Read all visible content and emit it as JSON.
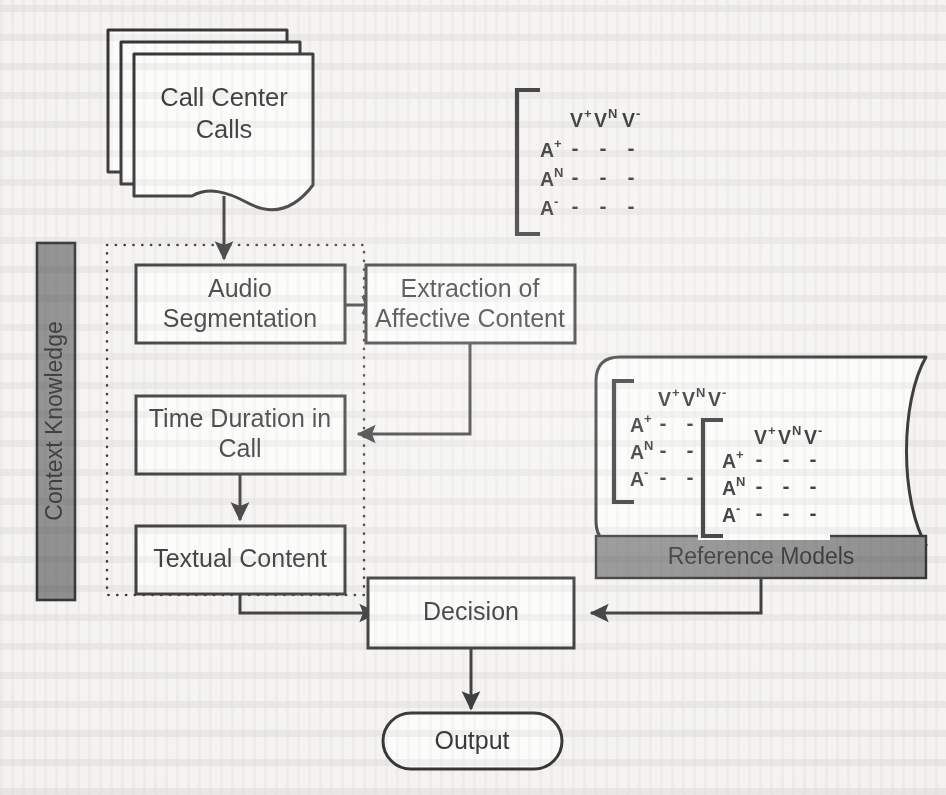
{
  "figure": {
    "background_color": "#f3f2f0",
    "line_color": "#1c1c1c",
    "shape_fill": "#fbfbfa",
    "accent_gray": "#808080",
    "boundary_style": "dotted"
  },
  "nodes": {
    "input_document": {
      "label_line1": "Call Center",
      "label_line2": "Calls",
      "shape": "multi-document"
    },
    "audio_segmentation": {
      "label_line1": "Audio",
      "label_line2": "Segmentation",
      "shape": "process"
    },
    "extraction": {
      "label_line1": "Extraction of",
      "label_line2": "Affective Content",
      "shape": "process"
    },
    "time_duration": {
      "label_line1": "Time Duration in",
      "label_line2": "Call",
      "shape": "process"
    },
    "textual_content": {
      "label_line1": "Textual Content",
      "label_line2": "",
      "shape": "process"
    },
    "decision": {
      "label_line1": "Decision",
      "label_line2": "",
      "shape": "process"
    },
    "output": {
      "label_line1": "Output",
      "label_line2": "",
      "shape": "terminator"
    },
    "context_knowledge": {
      "label": "Context Knowledge",
      "shape": "vertical-gray-bar",
      "color": "#808080"
    },
    "reference_models": {
      "label": "Reference Models",
      "shape": "data-store",
      "band_color": "#808080"
    }
  },
  "matrices": {
    "column_headers": [
      {
        "base": "V",
        "sup": "+"
      },
      {
        "base": "V",
        "sup": "N"
      },
      {
        "base": "V",
        "sup": "-"
      }
    ],
    "row_headers": [
      {
        "base": "A",
        "sup": "+"
      },
      {
        "base": "A",
        "sup": "N"
      },
      {
        "base": "A",
        "sup": "-"
      }
    ],
    "cell_value": "-",
    "instances": [
      {
        "name": "input-matrix",
        "location": "top-right"
      },
      {
        "name": "reference-matrix-back",
        "location": "data-store-left"
      },
      {
        "name": "reference-matrix-front",
        "location": "data-store-center"
      }
    ]
  },
  "edges": [
    {
      "from": "input_document",
      "to": "audio_segmentation"
    },
    {
      "from": "audio_segmentation",
      "to": "extraction"
    },
    {
      "from": "extraction",
      "to": "time_duration"
    },
    {
      "from": "time_duration",
      "to": "textual_content"
    },
    {
      "from": "textual_content",
      "to": "decision"
    },
    {
      "from": "reference_models",
      "to": "decision"
    },
    {
      "from": "decision",
      "to": "output"
    }
  ]
}
